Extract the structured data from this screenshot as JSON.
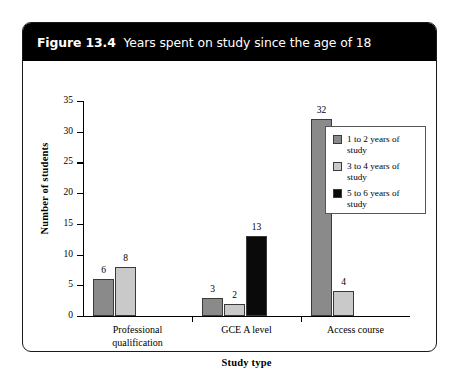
{
  "figure": {
    "number": "Figure 13.4",
    "title": "Years spent on study since the age of 18"
  },
  "chart_data": {
    "type": "bar",
    "title": "Years spent on study since the age of 18",
    "xlabel": "Study type",
    "ylabel": "Number of students",
    "ylim": [
      0,
      35
    ],
    "yticks": [
      0,
      5,
      10,
      15,
      20,
      25,
      30,
      35
    ],
    "ytick_labels": [
      "0",
      "5",
      "10",
      "15",
      "20",
      "25",
      "30",
      "35"
    ],
    "grid": false,
    "legend_position": "right",
    "categories": [
      "Professional qualification",
      "GCE A level",
      "Access course"
    ],
    "series": [
      {
        "name": "1 to 2 years of study",
        "color": "#8a8a8a",
        "values": [
          6,
          3,
          32
        ]
      },
      {
        "name": "3 to 4 years of study",
        "color": "#c9c9c9",
        "values": [
          8,
          2,
          4
        ]
      },
      {
        "name": "5 to 6 years of study",
        "color": "#0a0a0a",
        "values": [
          null,
          13,
          null
        ]
      }
    ],
    "bars": [
      {
        "category": "Professional qualification",
        "series": "1 to 2 years of study",
        "value": 6,
        "label": "6",
        "color": "#8a8a8a"
      },
      {
        "category": "Professional qualification",
        "series": "3 to 4 years of study",
        "value": 8,
        "label": "8",
        "color": "#c9c9c9"
      },
      {
        "category": "GCE A level",
        "series": "1 to 2 years of study",
        "value": 3,
        "label": "3",
        "color": "#8a8a8a"
      },
      {
        "category": "GCE A level",
        "series": "3 to 4 years of study",
        "value": 2,
        "label": "2",
        "color": "#c9c9c9"
      },
      {
        "category": "GCE A level",
        "series": "5 to 6 years of study",
        "value": 13,
        "label": "13",
        "color": "#0a0a0a"
      },
      {
        "category": "Access course",
        "series": "1 to 2 years of study",
        "value": 32,
        "label": "32",
        "color": "#8a8a8a"
      },
      {
        "category": "Access course",
        "series": "3 to 4 years of study",
        "value": 4,
        "label": "4",
        "color": "#c9c9c9"
      }
    ],
    "legend": [
      {
        "label_line1": "1 to 2 years of",
        "label_line2": "study",
        "color": "#8a8a8a"
      },
      {
        "label_line1": "3 to 4 years of",
        "label_line2": "study",
        "color": "#c9c9c9"
      },
      {
        "label_line1": "5 to 6 years of",
        "label_line2": "study",
        "color": "#0a0a0a"
      }
    ],
    "category_label_lines": [
      [
        "Professional",
        "qualification"
      ],
      [
        "GCE A level",
        ""
      ],
      [
        "Access course",
        ""
      ]
    ]
  },
  "colors": {
    "caption_bar": "#000000",
    "caption_text": "#ffffff",
    "frame_border": "#1a1a1a",
    "axis": "#000000",
    "series_1": "#8a8a8a",
    "series_2": "#c9c9c9",
    "series_3": "#0a0a0a"
  }
}
